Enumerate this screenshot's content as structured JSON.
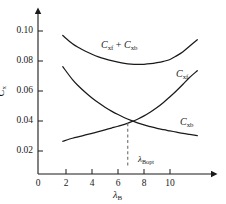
{
  "chart_data": {
    "type": "line",
    "title": "",
    "subtitle": "",
    "xlabel": "λB",
    "xlabel_base": "λ",
    "xlabel_sub": "B",
    "ylabel_base": "C",
    "ylabel_sub": "x",
    "xlim": [
      0,
      12.3
    ],
    "ylim": [
      0.0,
      0.108
    ],
    "grid": false,
    "legend_position": "inline-curve-labels",
    "xticks": [
      0,
      2,
      4,
      6,
      8,
      10
    ],
    "xticklabels": [
      "0",
      "2",
      "4",
      "6",
      "8",
      "10"
    ],
    "yticks": [
      0.02,
      0.04,
      0.06,
      0.08,
      0.1
    ],
    "yticklabels": [
      "0.02",
      "0.04",
      "0.06",
      "0.08",
      "0.10"
    ],
    "x": [
      1.75,
      2.5,
      3.0,
      3.5,
      4.0,
      4.5,
      5.0,
      5.5,
      6.0,
      6.5,
      7.0,
      7.5,
      8.0,
      8.5,
      9.0,
      9.5,
      10.0,
      10.5,
      11.0,
      11.5,
      12.1
    ],
    "series": [
      {
        "name": "C_xf + C_xb",
        "label_base": "C",
        "label_sub": "xf",
        "label_plus": "+",
        "label_base2": "C",
        "label_sub2": "xb",
        "values": [
          0.097,
          0.0915,
          0.0888,
          0.0865,
          0.0845,
          0.0828,
          0.0814,
          0.0802,
          0.0792,
          0.0784,
          0.0779,
          0.0777,
          0.0778,
          0.0782,
          0.0789,
          0.0798,
          0.081,
          0.0834,
          0.0862,
          0.0898,
          0.0942
        ]
      },
      {
        "name": "C_xf",
        "label_base": "C",
        "label_sub": "xf",
        "values": [
          0.0762,
          0.0676,
          0.063,
          0.059,
          0.0553,
          0.0521,
          0.0492,
          0.0466,
          0.0443,
          0.0422,
          0.0404,
          0.0388,
          0.0374,
          0.0362,
          0.0351,
          0.0342,
          0.0334,
          0.0326,
          0.0318,
          0.0311,
          0.0303
        ]
      },
      {
        "name": "C_xb",
        "label_base": "C",
        "label_sub": "xb",
        "values": [
          0.0265,
          0.0285,
          0.0296,
          0.0307,
          0.0318,
          0.0329,
          0.0341,
          0.0353,
          0.0365,
          0.0378,
          0.0394,
          0.0412,
          0.0434,
          0.046,
          0.049,
          0.0524,
          0.0562,
          0.0602,
          0.0645,
          0.069,
          0.0735
        ]
      }
    ],
    "annotations": [
      {
        "name": "lambda-B-opt",
        "text_base": "λ",
        "text_sub": "Bopt",
        "x": 6.75,
        "y": 0.0,
        "marker_y": 0.0385,
        "style": "dashed-vertical-line"
      }
    ],
    "colors": {
      "curve": "#1a1a1a",
      "axis": "#1a1a1a",
      "dashed": "#6d6d6d",
      "background": "#ffffff"
    }
  }
}
